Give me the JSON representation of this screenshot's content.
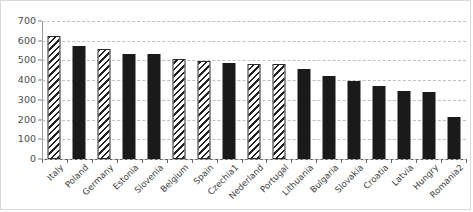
{
  "chart_data": {
    "type": "bar",
    "title": "",
    "subtitle": "",
    "xlabel": "",
    "ylabel": "",
    "ylim": [
      0,
      700
    ],
    "ytick_step": 100,
    "yticks": [
      0,
      100,
      200,
      300,
      400,
      500,
      600,
      700
    ],
    "ytick_labels": [
      "0",
      "100",
      "200",
      "300",
      "400",
      "500",
      "600",
      "700"
    ],
    "grid": true,
    "grid_axis": "y",
    "grid_style": "dashed",
    "legend": false,
    "legend_position": "none",
    "categories": [
      "Italy",
      "Poland",
      "Germany",
      "Estonia",
      "Slovenia",
      "Belgium",
      "Spain",
      "Czechia1",
      "Nederland",
      "Portugal",
      "Lithuania",
      "Bulgaria",
      "Slovakia",
      "Croatia",
      "Latvia",
      "Hungry",
      "Romania2"
    ],
    "values": [
      625,
      572,
      558,
      535,
      533,
      508,
      498,
      487,
      483,
      480,
      455,
      420,
      398,
      370,
      345,
      342,
      215
    ],
    "bar_patterns": [
      "hatch",
      "solid",
      "hatch",
      "solid",
      "solid",
      "hatch",
      "hatch",
      "solid",
      "hatch",
      "hatch",
      "solid",
      "solid",
      "solid",
      "solid",
      "solid",
      "solid",
      "solid"
    ],
    "colors": {
      "solid_fill": "#1a1a1a",
      "hatch_fill": "#ffffff",
      "hatch_line": "#232323",
      "gridline": "#bfbfbf",
      "axis": "#5a5a5a",
      "tick_text": "#4d4d4d",
      "category_text": "#3d3d3d",
      "figure_border": "#d9d9d9",
      "background": "#ffffff"
    }
  }
}
